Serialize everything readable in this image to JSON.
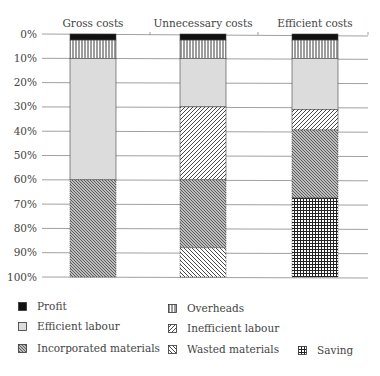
{
  "chart_data": {
    "type": "bar",
    "stacked": true,
    "orientation": "vertical",
    "y_axis_inverted": true,
    "title": "",
    "xlabel": "",
    "ylabel": "",
    "ylim": [
      0,
      100
    ],
    "y_ticks": [
      "0%",
      "10%",
      "20%",
      "30%",
      "40%",
      "50%",
      "60%",
      "70%",
      "80%",
      "90%",
      "100%"
    ],
    "grid": true,
    "legend_position": "bottom",
    "categories": [
      "Gross costs",
      "Unnecessary costs",
      "Efficient costs"
    ],
    "series": [
      {
        "name": "Profit",
        "pattern": "solid-black",
        "values": [
          2.5,
          2.5,
          2.5
        ]
      },
      {
        "name": "Overheads",
        "pattern": "vertical-lines",
        "values": [
          7.5,
          7.5,
          7.5
        ]
      },
      {
        "name": "Efficient labour",
        "pattern": "light-grey",
        "values": [
          50,
          20,
          21
        ]
      },
      {
        "name": "Inefficient labour",
        "pattern": "wide-diagonal",
        "values": [
          0,
          30,
          8.5
        ]
      },
      {
        "name": "Incorporated materials",
        "pattern": "dense-diagonal",
        "values": [
          40,
          28,
          28
        ]
      },
      {
        "name": "Wasted materials",
        "pattern": "back-diagonal",
        "values": [
          0,
          12,
          0
        ]
      },
      {
        "name": "Saving",
        "pattern": "crosshatch-grid",
        "values": [
          0,
          0,
          32.5
        ]
      }
    ]
  },
  "legend": {
    "items": [
      {
        "label": "Profit",
        "pattern": "solid-black"
      },
      {
        "label": "Overheads",
        "pattern": "vertical-lines"
      },
      {
        "label": "Efficient labour",
        "pattern": "light-grey"
      },
      {
        "label": "Inefficient labour",
        "pattern": "wide-diagonal"
      },
      {
        "label": "Incorporated materials",
        "pattern": "dense-diagonal"
      },
      {
        "label": "Wasted materials",
        "pattern": "back-diagonal"
      },
      {
        "label": "Saving",
        "pattern": "crosshatch-grid"
      }
    ]
  },
  "colors": {
    "profit": "#111111",
    "efficient_labour": "#dcdcdc",
    "gridline": "#888888",
    "text": "#444444"
  }
}
